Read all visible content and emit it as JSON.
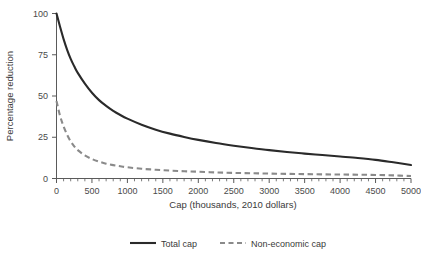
{
  "chart_data": {
    "type": "line",
    "title": "",
    "xlabel": "Cap (thousands, 2010 dollars)",
    "ylabel": "Percentage reduction",
    "xlim": [
      0,
      5000
    ],
    "ylim": [
      0,
      100
    ],
    "grid": false,
    "legend_position": "bottom-center",
    "xticks": [
      0,
      500,
      1000,
      1500,
      2000,
      2500,
      3000,
      3500,
      4000,
      4500,
      5000
    ],
    "xtick_labels": [
      "0",
      "500",
      "1000",
      "1500",
      "2000",
      "2500",
      "3000",
      "3500",
      "4000",
      "4500",
      "5000"
    ],
    "yticks": [
      0,
      25,
      50,
      75,
      100
    ],
    "ytick_labels": [
      "0",
      "25",
      "50",
      "75",
      "100"
    ],
    "x": [
      0,
      50,
      100,
      150,
      200,
      250,
      300,
      400,
      500,
      600,
      700,
      800,
      900,
      1000,
      1200,
      1400,
      1600,
      1800,
      2000,
      2250,
      2500,
      2750,
      3000,
      3250,
      3500,
      3750,
      4000,
      4250,
      4500,
      4750,
      5000
    ],
    "series": [
      {
        "name": "Total cap",
        "style": "solid",
        "color": "#2a2a2a",
        "values": [
          100,
          92,
          84.5,
          78,
          72.5,
          68,
          64,
          57.5,
          52,
          47.5,
          44,
          41,
          38.5,
          36.3,
          32.6,
          29.6,
          27.2,
          25.2,
          23.4,
          21.5,
          19.9,
          18.5,
          17.2,
          16.1,
          15.1,
          14.2,
          13.3,
          12.4,
          11.3,
          9.8,
          8.2
        ]
      },
      {
        "name": "Non-economic cap",
        "style": "dashed",
        "color": "#8a8a8a",
        "values": [
          47,
          38,
          31.5,
          26.5,
          22.5,
          19.5,
          17.2,
          14,
          11.8,
          10.2,
          9,
          8.1,
          7.4,
          6.8,
          5.9,
          5.3,
          4.8,
          4.4,
          4.1,
          3.7,
          3.4,
          3.2,
          3,
          2.8,
          2.65,
          2.5,
          2.4,
          2.3,
          2.15,
          1.9,
          1.5
        ]
      }
    ]
  },
  "legend": {
    "items": [
      {
        "label": "Total cap"
      },
      {
        "label": "Non-economic cap"
      }
    ]
  },
  "colors": {
    "total_cap": "#2a2a2a",
    "non_economic_cap": "#8a8a8a",
    "axis": "#5a5a5a",
    "background": "#ffffff"
  }
}
